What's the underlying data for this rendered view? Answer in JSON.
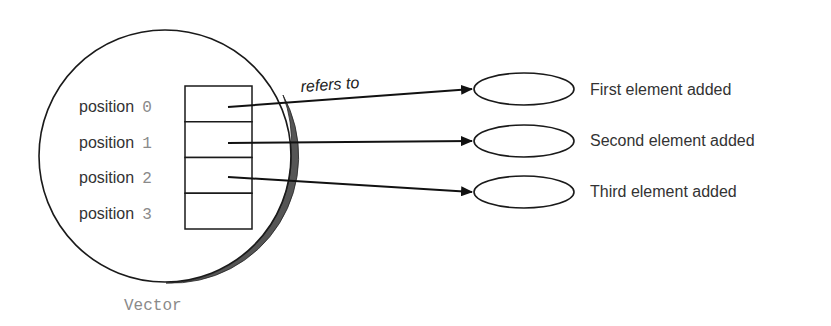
{
  "diagram": {
    "container": {
      "label": "Vector",
      "shape": "circle",
      "center": [
        166,
        156
      ],
      "radius": 126
    },
    "slots": [
      {
        "word": "position",
        "index": "0",
        "ref": 0
      },
      {
        "word": "position",
        "index": "1",
        "ref": 1
      },
      {
        "word": "position",
        "index": "2",
        "ref": 2
      },
      {
        "word": "position",
        "index": "3",
        "ref": null
      }
    ],
    "edge_label": "refers to",
    "elements": [
      {
        "label": "First element added"
      },
      {
        "label": "Second element added"
      },
      {
        "label": "Third element added"
      }
    ],
    "colors": {
      "stroke": "#1a1a1a",
      "text": "#333333",
      "index_text": "#8a8a8a",
      "shadow": "#555555"
    }
  }
}
